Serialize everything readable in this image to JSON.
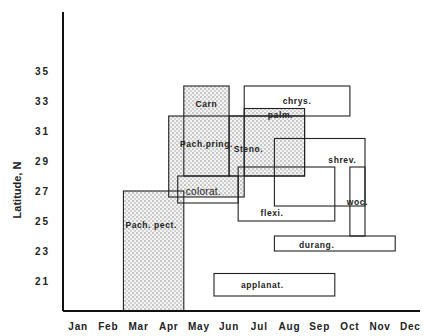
{
  "chart_data": {
    "type": "range-box",
    "title": "",
    "xlabel": "",
    "ylabel": "Latitude,  N",
    "x_categories": [
      "Jan",
      "Feb",
      "Mar",
      "Apr",
      "May",
      "Jun",
      "Jul",
      "Aug",
      "Sep",
      "Oct",
      "Nov",
      "Dec"
    ],
    "y_ticks": [
      "35",
      "33",
      "31",
      "29",
      "27",
      "25",
      "23",
      "21"
    ],
    "y_tick_values": [
      35,
      33,
      31,
      29,
      27,
      25,
      23,
      21
    ],
    "xlim_months": [
      0,
      12
    ],
    "ylim": [
      19,
      36.5
    ],
    "grid": false,
    "legend": "none",
    "boxes": [
      {
        "name": "Pach. pect.",
        "month_start": 2.0,
        "month_end": 4.0,
        "lat_min": 19.0,
        "lat_max": 27.0,
        "shaded": true,
        "label_style": "bold"
      },
      {
        "name": "Pach.pring.",
        "month_start": 3.5,
        "month_end": 6.0,
        "lat_min": 26.6,
        "lat_max": 32.0,
        "shaded": true,
        "label_style": "bold"
      },
      {
        "name": "Carn",
        "month_start": 4.0,
        "month_end": 5.5,
        "lat_min": 28.0,
        "lat_max": 34.0,
        "shaded": true,
        "label_style": "bold"
      },
      {
        "name": "colorat.",
        "month_start": 3.8,
        "month_end": 5.8,
        "lat_min": 26.2,
        "lat_max": 28.0,
        "shaded": false,
        "label_style": "light"
      },
      {
        "name": "Steno.",
        "month_start": 5.5,
        "month_end": 8.0,
        "lat_min": 28.0,
        "lat_max": 32.0,
        "shaded": true,
        "label_style": "bold"
      },
      {
        "name": "chrys.",
        "month_start": 6.0,
        "month_end": 9.5,
        "lat_min": 32.0,
        "lat_max": 34.0,
        "shaded": false,
        "label_style": "bold"
      },
      {
        "name": "palm.",
        "month_start": 6.0,
        "month_end": 8.0,
        "lat_min": 28.0,
        "lat_max": 32.5,
        "shaded": true,
        "label_style": "bold"
      },
      {
        "name": "flexi.",
        "month_start": 5.8,
        "month_end": 9.0,
        "lat_min": 25.0,
        "lat_max": 28.6,
        "shaded": false,
        "label_style": "bold"
      },
      {
        "name": "shrev.",
        "month_start": 7.0,
        "month_end": 10.0,
        "lat_min": 26.0,
        "lat_max": 30.5,
        "shaded": false,
        "label_style": "bold"
      },
      {
        "name": "woc.",
        "month_start": 9.5,
        "month_end": 10.0,
        "lat_min": 24.0,
        "lat_max": 28.6,
        "shaded": false,
        "label_style": "bold"
      },
      {
        "name": "durang.",
        "month_start": 7.0,
        "month_end": 11.0,
        "lat_min": 23.0,
        "lat_max": 24.0,
        "shaded": false,
        "label_style": "bold"
      },
      {
        "name": "applanat.",
        "month_start": 5.0,
        "month_end": 9.0,
        "lat_min": 20.0,
        "lat_max": 21.5,
        "shaded": false,
        "label_style": "bold"
      }
    ]
  }
}
